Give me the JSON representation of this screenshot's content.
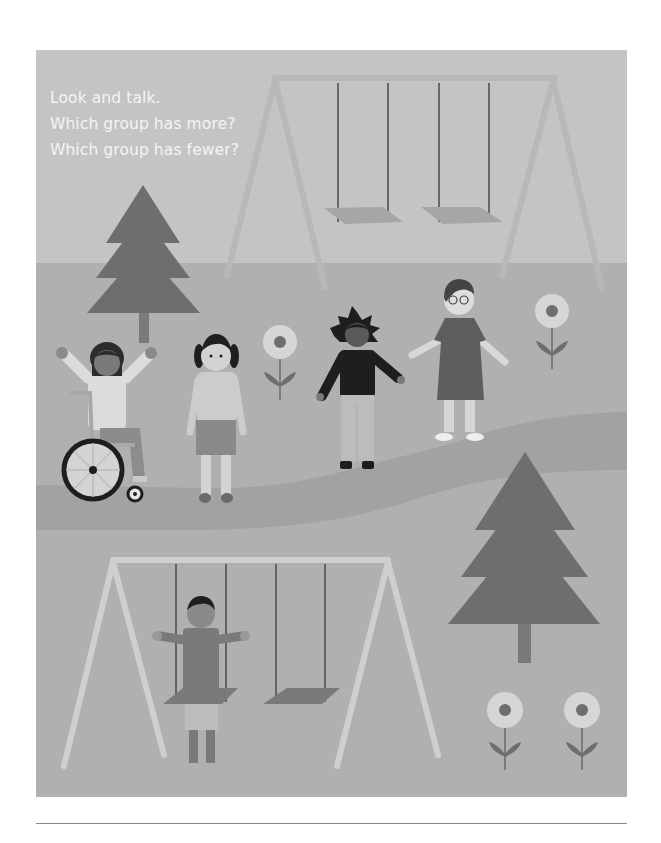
{
  "prompt": {
    "lines": [
      "Look and talk.",
      "Which group has more?",
      "Which group has fewer?"
    ]
  },
  "scene": {
    "description": "Playground illustration: two swing sets, five children, two pine trees, four flowers",
    "groups": {
      "children_standing_upper": 5,
      "children_on_swings": 1,
      "swings_top_set": 2,
      "swings_bottom_set": 2,
      "trees": 2,
      "flowers": 4
    }
  },
  "colors": {
    "page_bg": "#ffffff",
    "sky": "#c4c4c4",
    "ground": "#b0b0b0",
    "path": "#a2a2a2",
    "tree": "#6e6e6e",
    "swing_frame": "#cfcfcf",
    "swing_seat": "#8c8c8c",
    "rope": "#4a4a4a",
    "text": "#f4f4f4",
    "rule": "#8a8a8a"
  }
}
